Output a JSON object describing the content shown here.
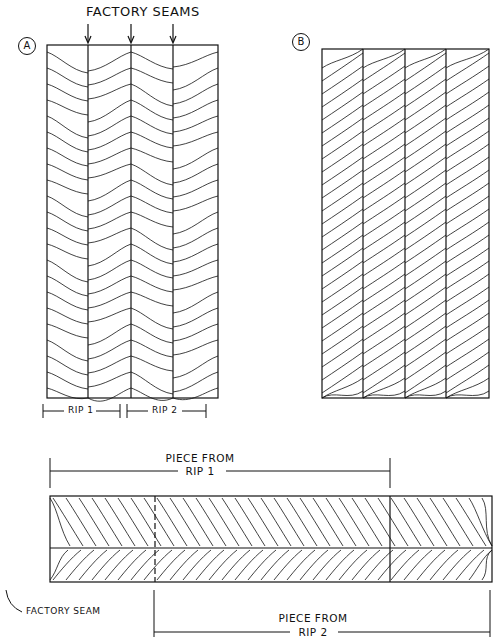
{
  "figure": {
    "title": "FACTORY SEAMS",
    "panel_a": {
      "label": "A",
      "rip_labels": [
        "RIP 1",
        "RIP 2"
      ]
    },
    "panel_b": {
      "label": "B"
    },
    "bottom": {
      "piece_rip1_line1": "PIECE FROM",
      "piece_rip1_line2": "RIP 1",
      "piece_rip2_line1": "PIECE FROM",
      "piece_rip2_line2": "RIP 2",
      "seam_label": "FACTORY SEAM"
    },
    "colors": {
      "ink": "#111111",
      "background": "#ffffff"
    }
  }
}
